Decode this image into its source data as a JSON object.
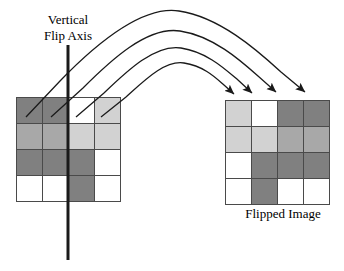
{
  "figure": {
    "axis_label": "Vertical\nFlip Axis",
    "axis_label_line1": "Vertical",
    "axis_label_line2": "Flip Axis",
    "flipped_label": "Flipped Image"
  },
  "palette": {
    "white": "#ffffff",
    "light_gray": "#d2d2d2",
    "medium_gray": "#a8a8a8",
    "dark_gray": "#808080",
    "grid_line": "#4a4a4a",
    "stroke": "#1a1a1a",
    "background": "#ffffff"
  },
  "grids": {
    "original": {
      "name": "original-image-grid",
      "rows": 4,
      "cols": 4,
      "cells": [
        [
          "dark_gray",
          "dark_gray",
          "white",
          "light_gray"
        ],
        [
          "medium_gray",
          "medium_gray",
          "light_gray",
          "light_gray"
        ],
        [
          "dark_gray",
          "dark_gray",
          "dark_gray",
          "white"
        ],
        [
          "white",
          "white",
          "dark_gray",
          "white"
        ]
      ]
    },
    "flipped": {
      "name": "flipped-image-grid",
      "rows": 4,
      "cols": 4,
      "cells": [
        [
          "light_gray",
          "white",
          "dark_gray",
          "dark_gray"
        ],
        [
          "light_gray",
          "light_gray",
          "medium_gray",
          "medium_gray"
        ],
        [
          "white",
          "dark_gray",
          "dark_gray",
          "dark_gray"
        ],
        [
          "white",
          "dark_gray",
          "white",
          "white"
        ]
      ]
    }
  },
  "axis_line": {
    "name": "vertical-flip-axis-line",
    "x": 68,
    "y_top": 45,
    "y_bottom": 260,
    "width": 3
  },
  "arcs": [
    {
      "name": "mapping-arc-1",
      "from_cell": "original-r1c1",
      "to_cell": "flipped-r1c4"
    },
    {
      "name": "mapping-arc-2",
      "from_cell": "original-r1c2",
      "to_cell": "flipped-r1c3"
    },
    {
      "name": "mapping-arc-3",
      "from_cell": "original-r1c3",
      "to_cell": "flipped-r1c2"
    },
    {
      "name": "mapping-arc-4",
      "from_cell": "original-r1c4",
      "to_cell": "flipped-r1c1"
    }
  ]
}
